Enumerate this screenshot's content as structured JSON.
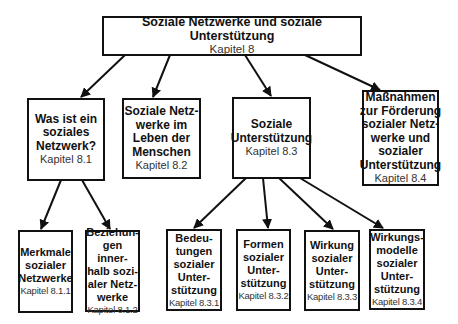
{
  "diagram": {
    "root": {
      "title": "Soziale Netzwerke und soziale Unterstützung",
      "chapter": "Kapitel 8"
    },
    "level1": [
      {
        "title": "Was ist ein\nsoziales\nNetzwerk?",
        "chapter": "Kapitel 8.1"
      },
      {
        "title": "Soziale Netz-\nwerke im\nLeben der\nMenschen",
        "chapter": "Kapitel 8.2"
      },
      {
        "title": "Soziale\nUnterstützung",
        "chapter": "Kapitel 8.3"
      },
      {
        "title": "Maßnahmen\nzur Förderung\nsozialer Netz-\nwerke und\nsozialer\nUnterstützung",
        "chapter": "Kapitel 8.4"
      }
    ],
    "level2_8_1": [
      {
        "title": "Merkmale\nsozialer\nNetzwerke",
        "chapter": "Kapitel 8.1.1"
      },
      {
        "title": "Beziehun-\ngen inner-\nhalb sozi-\naler Netz-\nwerke",
        "chapter": "Kapitel 8.1.2"
      }
    ],
    "level2_8_3": [
      {
        "title": "Bedeu-\ntungen\nsozialer\nUnter-\nstützung",
        "chapter": "Kapitel 8.3.1"
      },
      {
        "title": "Formen\nsozialer\nUnter-\nstützung",
        "chapter": "Kapitel 8.3.2"
      },
      {
        "title": "Wirkung\nsozialer\nUnter-\nstützung",
        "chapter": "Kapitel 8.3.3"
      },
      {
        "title": "Wirkungs-\nmodelle\nsozialer\nUnter-\nstützung",
        "chapter": "Kapitel 8.3.4"
      }
    ],
    "edges": [
      [
        "Kapitel 8",
        "Kapitel 8.1"
      ],
      [
        "Kapitel 8",
        "Kapitel 8.2"
      ],
      [
        "Kapitel 8",
        "Kapitel 8.3"
      ],
      [
        "Kapitel 8",
        "Kapitel 8.4"
      ],
      [
        "Kapitel 8.1",
        "Kapitel 8.1.1"
      ],
      [
        "Kapitel 8.1",
        "Kapitel 8.1.2"
      ],
      [
        "Kapitel 8.3",
        "Kapitel 8.3.1"
      ],
      [
        "Kapitel 8.3",
        "Kapitel 8.3.2"
      ],
      [
        "Kapitel 8.3",
        "Kapitel 8.3.3"
      ],
      [
        "Kapitel 8.3",
        "Kapitel 8.3.4"
      ]
    ],
    "colors": {
      "line": "#111111",
      "background": "#ffffff",
      "chapter_text": "#333333"
    }
  }
}
